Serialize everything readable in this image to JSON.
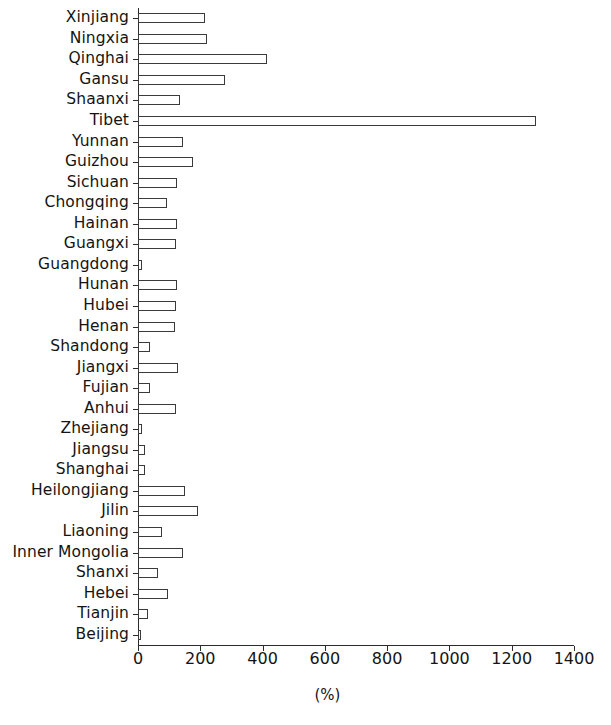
{
  "chart_data": {
    "type": "bar",
    "orientation": "horizontal",
    "title": "",
    "subtitle": "",
    "xlabel": "(%)",
    "ylabel": "",
    "xlim": [
      0,
      1400
    ],
    "xticks": [
      0,
      200,
      400,
      600,
      800,
      1000,
      1200,
      1400
    ],
    "xtick_labels": [
      "0",
      "200",
      "400",
      "600",
      "800",
      "1000",
      "1200",
      "1400"
    ],
    "grid": false,
    "legend": null,
    "bar_style": {
      "fill": "#ffffff",
      "edge": "#3a3a3a",
      "edge_width": 1
    },
    "categories": [
      "Xinjiang",
      "Ningxia",
      "Qinghai",
      "Gansu",
      "Shaanxi",
      "Tibet",
      "Yunnan",
      "Guizhou",
      "Sichuan",
      "Chongqing",
      "Hainan",
      "Guangxi",
      "Guangdong",
      "Hunan",
      "Hubei",
      "Henan",
      "Shandong",
      "Jiangxi",
      "Fujian",
      "Anhui",
      "Zhejiang",
      "Jiangsu",
      "Shanghai",
      "Heilongjiang",
      "Jilin",
      "Liaoning",
      "Inner Mongolia",
      "Shanxi",
      "Hebei",
      "Tianjin",
      "Beijing"
    ],
    "values": [
      215,
      222,
      415,
      280,
      135,
      1278,
      145,
      175,
      125,
      92,
      125,
      122,
      13,
      125,
      122,
      118,
      38,
      128,
      38,
      122,
      13,
      22,
      22,
      152,
      193,
      77,
      145,
      64,
      96,
      32,
      10
    ]
  }
}
